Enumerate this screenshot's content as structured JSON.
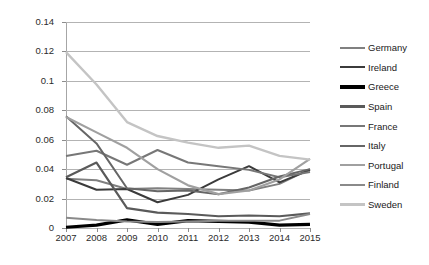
{
  "chart_data": {
    "type": "line",
    "title": "",
    "xlabel": "",
    "ylabel": "",
    "x": [
      2007,
      2008,
      2009,
      2010,
      2011,
      2012,
      2013,
      2014,
      2015
    ],
    "xtick_labels": [
      "2007",
      "2008",
      "2009",
      "2010",
      "2011",
      "2012",
      "2013",
      "2014",
      "2015"
    ],
    "ytick_labels": [
      "0",
      "0.02",
      "0.04",
      "0.06",
      "0.08",
      "0.1",
      "0.12",
      "0.14"
    ],
    "ylim": [
      0,
      0.14
    ],
    "ystep": 0.02,
    "grid": "horizontal",
    "legend_position": "right",
    "series": [
      {
        "name": "Germany",
        "color": "#808080",
        "width": 2.0,
        "values": [
          0.0335,
          0.0325,
          0.0265,
          0.027,
          0.0265,
          0.026,
          0.0255,
          0.03,
          0.04
        ]
      },
      {
        "name": "Ireland",
        "color": "#3b3b3b",
        "width": 2.0,
        "values": [
          0.034,
          0.026,
          0.0265,
          0.0175,
          0.0225,
          0.033,
          0.042,
          0.031,
          0.0395
        ]
      },
      {
        "name": "Greece",
        "color": "#000000",
        "width": 3.2,
        "values": [
          0.0005,
          0.002,
          0.0055,
          0.0025,
          0.005,
          0.0045,
          0.004,
          0.002,
          0.0025
        ]
      },
      {
        "name": "Spain",
        "color": "#5a5a5a",
        "width": 2.2,
        "values": [
          0.0345,
          0.0445,
          0.0135,
          0.0105,
          0.0095,
          0.008,
          0.0085,
          0.008,
          0.01
        ]
      },
      {
        "name": "France",
        "color": "#777777",
        "width": 2.0,
        "values": [
          0.049,
          0.0525,
          0.043,
          0.053,
          0.0445,
          0.042,
          0.0395,
          0.0345,
          0.038
        ]
      },
      {
        "name": "Italy",
        "color": "#666666",
        "width": 2.0,
        "values": [
          0.076,
          0.0575,
          0.027,
          0.025,
          0.0255,
          0.023,
          0.0275,
          0.035,
          0.04
        ]
      },
      {
        "name": "Portugal",
        "color": "#a0a0a0",
        "width": 2.2,
        "values": [
          0.0755,
          0.065,
          0.0545,
          0.04,
          0.029,
          0.023,
          0.0255,
          0.033,
          0.047
        ]
      },
      {
        "name": "Finland",
        "color": "#8a8a8a",
        "width": 2.0,
        "values": [
          0.007,
          0.0055,
          0.0045,
          0.004,
          0.0045,
          0.005,
          0.005,
          0.005,
          0.0095
        ]
      },
      {
        "name": "Sweden",
        "color": "#c4c4c4",
        "width": 2.4,
        "values": [
          0.1195,
          0.0975,
          0.072,
          0.0625,
          0.058,
          0.0545,
          0.056,
          0.049,
          0.0465
        ]
      }
    ]
  }
}
